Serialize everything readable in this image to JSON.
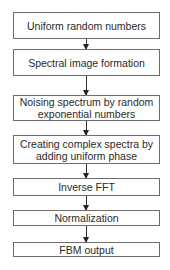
{
  "flowchart": {
    "steps": [
      {
        "label": "Uniform random numbers"
      },
      {
        "label": "Spectral image formation"
      },
      {
        "label": "Noising spectrum by random exponential numbers"
      },
      {
        "label": "Creating complex spectra by adding uniform phase"
      },
      {
        "label": "Inverse FFT"
      },
      {
        "label": "Normalization"
      },
      {
        "label": "FBM output"
      }
    ],
    "colors": {
      "border": "#6e6e6e",
      "arrow": "#222222",
      "background": "#ffffff"
    }
  }
}
